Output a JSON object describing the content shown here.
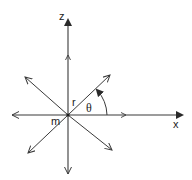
{
  "diagram": {
    "type": "polar-coordinate-axes",
    "stroke_color": "#3a3a3a",
    "labels": {
      "z_axis": "z",
      "x_axis": "x",
      "radius": "r",
      "angle": "θ",
      "mass": "m"
    },
    "origin": [
      68,
      115
    ],
    "axes": [
      {
        "name": "z-axis-positive",
        "to": [
          68,
          18
        ],
        "head": "filled"
      },
      {
        "name": "z-axis-negative",
        "to": [
          68,
          175
        ],
        "head": "open"
      },
      {
        "name": "x-axis-positive",
        "to": [
          184,
          115
        ],
        "head": "filled"
      },
      {
        "name": "x-axis-negative",
        "to": [
          12,
          115
        ],
        "head": "open"
      }
    ],
    "diagonals": [
      {
        "name": "upper-right",
        "to": [
          110,
          75
        ]
      },
      {
        "name": "upper-left",
        "to": [
          25,
          77
        ]
      },
      {
        "name": "lower-left",
        "to": [
          28,
          153
        ]
      },
      {
        "name": "lower-right",
        "to": [
          112,
          150
        ]
      }
    ]
  }
}
